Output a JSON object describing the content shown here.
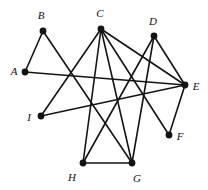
{
  "figure": {
    "kind": "undirected-graph-diagram",
    "width": 208,
    "height": 190,
    "background_color": "#ffffff",
    "edge_color": "#141414",
    "vertex_color": "#141414",
    "label_color": "#111111",
    "edge_width": 1.6,
    "vertex_radius": 3.4
  },
  "chart_data": {
    "type": "scatter",
    "title": "",
    "xlabel": "",
    "ylabel": "",
    "grid": false,
    "legend": null,
    "xlim": [
      0,
      208
    ],
    "ylim": [
      0,
      190
    ],
    "nodes": [
      {
        "id": "A",
        "label": "A",
        "x": 25,
        "y": 72,
        "label_x": 14,
        "label_y": 71
      },
      {
        "id": "B",
        "label": "B",
        "x": 43,
        "y": 31,
        "label_x": 41,
        "label_y": 15
      },
      {
        "id": "C",
        "label": "C",
        "x": 101,
        "y": 29,
        "label_x": 100,
        "label_y": 13
      },
      {
        "id": "D",
        "label": "D",
        "x": 154,
        "y": 36,
        "label_x": 153,
        "label_y": 21
      },
      {
        "id": "E",
        "label": "E",
        "x": 185,
        "y": 85,
        "label_x": 196,
        "label_y": 86
      },
      {
        "id": "F",
        "label": "F",
        "x": 169,
        "y": 135,
        "label_x": 180,
        "label_y": 136
      },
      {
        "id": "G",
        "label": "G",
        "x": 132,
        "y": 163,
        "label_x": 137,
        "label_y": 178
      },
      {
        "id": "H",
        "label": "H",
        "x": 83,
        "y": 163,
        "label_x": 72,
        "label_y": 177
      },
      {
        "id": "I",
        "label": "I",
        "x": 41,
        "y": 116,
        "label_x": 29,
        "label_y": 117
      }
    ],
    "edges": [
      {
        "from": "A",
        "to": "B"
      },
      {
        "from": "A",
        "to": "E"
      },
      {
        "from": "B",
        "to": "G"
      },
      {
        "from": "C",
        "to": "I"
      },
      {
        "from": "C",
        "to": "H"
      },
      {
        "from": "C",
        "to": "G"
      },
      {
        "from": "C",
        "to": "F"
      },
      {
        "from": "C",
        "to": "E"
      },
      {
        "from": "D",
        "to": "H"
      },
      {
        "from": "D",
        "to": "G"
      },
      {
        "from": "D",
        "to": "E"
      },
      {
        "from": "E",
        "to": "I"
      },
      {
        "from": "E",
        "to": "F"
      },
      {
        "from": "G",
        "to": "H"
      }
    ]
  }
}
